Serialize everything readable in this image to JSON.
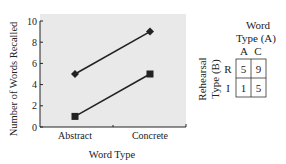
{
  "chart_data": {
    "type": "line",
    "title": "",
    "xlabel": "Word Type",
    "ylabel": "Number of Words Recalled",
    "categories": [
      "Abstract",
      "Concrete"
    ],
    "ylim": [
      0,
      10
    ],
    "yticks": [
      0,
      2,
      4,
      6,
      8,
      10
    ],
    "grid": false,
    "legend": "none",
    "series": [
      {
        "name": "R",
        "marker": "diamond",
        "values": [
          5,
          9
        ]
      },
      {
        "name": "I",
        "marker": "square",
        "values": [
          1,
          5
        ]
      }
    ],
    "background": "#e9e9e9",
    "line_color": "#222222"
  },
  "table": {
    "title_line1": "Word",
    "title_line2": "Type (A)",
    "col_headers": [
      "A",
      "C"
    ],
    "row_axis_line1": "Rehearsal",
    "row_axis_line2": "Type (B)",
    "row_headers": [
      "R",
      "I"
    ],
    "cells": [
      [
        5,
        9
      ],
      [
        1,
        5
      ]
    ]
  }
}
